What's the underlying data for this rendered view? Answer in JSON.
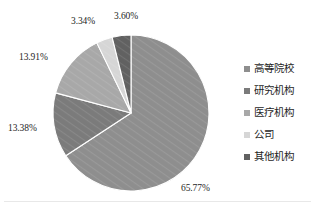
{
  "chart_data": {
    "type": "pie",
    "title": "",
    "subtitle": "",
    "xlabel": "",
    "ylabel": "",
    "grid": false,
    "legend_position": "right",
    "start_angle_deg": 0,
    "direction": "clockwise",
    "center": {
      "x": 131,
      "y": 113
    },
    "radius": 78,
    "separator_color": "#ffffff",
    "categories": [
      "高等院校",
      "研究机构",
      "医疗机构",
      "公司",
      "其他机构"
    ],
    "values": [
      65.77,
      13.38,
      13.91,
      3.34,
      3.6
    ],
    "labels": [
      "65.77%",
      "13.38%",
      "13.91%",
      "3.34%",
      "3.60%"
    ],
    "colors": [
      "#8e8e8e",
      "#7b7b7b",
      "#a8a8a8",
      "#d6d6d6",
      "#616161"
    ],
    "slices": [
      {
        "name": "高等院校",
        "value": 65.77,
        "label": "65.77%",
        "color": "#8e8e8e",
        "start_deg": 0.0,
        "end_deg": 236.772,
        "label_pos": {
          "x": 181,
          "y": 184
        }
      },
      {
        "name": "研究机构",
        "value": 13.38,
        "label": "13.38%",
        "color": "#7b7b7b",
        "start_deg": 236.772,
        "end_deg": 284.94,
        "label_pos": {
          "x": 8,
          "y": 124
        }
      },
      {
        "name": "医疗机构",
        "value": 13.91,
        "label": "13.91%",
        "color": "#a8a8a8",
        "start_deg": 284.94,
        "end_deg": 334.0156,
        "label_pos": {
          "x": 19,
          "y": 53
        }
      },
      {
        "name": "公司",
        "value": 3.34,
        "label": "3.34%",
        "color": "#d6d6d6",
        "start_deg": 334.0156,
        "end_deg": 346.0396,
        "label_pos": {
          "x": 71,
          "y": 17
        }
      },
      {
        "name": "其他机构",
        "value": 3.6,
        "label": "3.60%",
        "color": "#616161",
        "start_deg": 346.0396,
        "end_deg": 360.0,
        "label_pos": {
          "x": 114,
          "y": 12
        }
      }
    ]
  },
  "legend": {
    "items": [
      {
        "label": "高等院校",
        "color": "#8e8e8e"
      },
      {
        "label": "研究机构",
        "color": "#7b7b7b"
      },
      {
        "label": "医疗机构",
        "color": "#a8a8a8"
      },
      {
        "label": "公司",
        "color": "#d6d6d6"
      },
      {
        "label": "其他机构",
        "color": "#616161"
      }
    ]
  }
}
